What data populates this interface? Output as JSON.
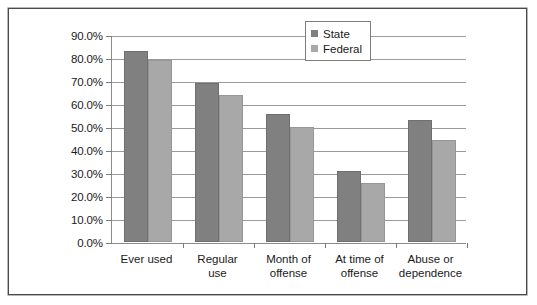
{
  "chart_data": {
    "type": "bar",
    "title": "",
    "subtitle": "",
    "xlabel": "",
    "ylabel": "",
    "ylim": [
      0,
      90
    ],
    "grid": true,
    "legend_position": "top-right",
    "categories": [
      "Ever used",
      "Regular use",
      "Month of offense",
      "At time of offense",
      "Abuse or dependence"
    ],
    "series": [
      {
        "name": "State",
        "color": "#808080",
        "values": [
          83.0,
          69.0,
          55.5,
          31.0,
          53.0
        ]
      },
      {
        "name": "Federal",
        "color": "#a8a8a8",
        "values": [
          79.0,
          64.0,
          50.0,
          25.5,
          44.5
        ]
      }
    ],
    "y_ticks": [
      {
        "value": 90,
        "label": "90.0%"
      },
      {
        "value": 80,
        "label": "80.0%"
      },
      {
        "value": 70,
        "label": "70.0%"
      },
      {
        "value": 60,
        "label": "60.0%"
      },
      {
        "value": 50,
        "label": "50.0%"
      },
      {
        "value": 40,
        "label": "40.0%"
      },
      {
        "value": 30,
        "label": "30.0%"
      },
      {
        "value": 20,
        "label": "20.0%"
      },
      {
        "value": 10,
        "label": "10.0%"
      },
      {
        "value": 0,
        "label": "0.0%"
      }
    ],
    "x_tick_labels": [
      [
        "Ever used"
      ],
      [
        "Regular",
        "use"
      ],
      [
        "Month of",
        "offense"
      ],
      [
        "At time of",
        "offense"
      ],
      [
        "Abuse or",
        "dependence"
      ]
    ]
  },
  "legend": {
    "items": [
      {
        "label": "State",
        "color": "#808080"
      },
      {
        "label": "Federal",
        "color": "#a8a8a8"
      }
    ]
  },
  "colors": {
    "frame": "#4a4a4a",
    "gridline": "#9a9a9a",
    "axis": "#8c8c8c",
    "state": "#808080",
    "federal": "#a8a8a8",
    "background": "#ffffff",
    "text": "#1a1a1a"
  }
}
